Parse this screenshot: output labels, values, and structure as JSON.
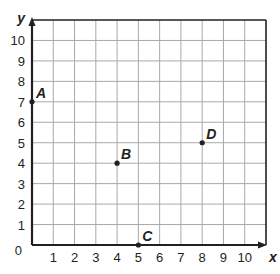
{
  "chart_data": {
    "type": "scatter",
    "title": "",
    "xlabel": "x",
    "ylabel": "y",
    "xlim": [
      0,
      11
    ],
    "ylim": [
      0,
      11
    ],
    "grid": true,
    "x_ticks": [
      "1",
      "2",
      "3",
      "4",
      "5",
      "6",
      "7",
      "8",
      "9",
      "10"
    ],
    "y_ticks": [
      "1",
      "2",
      "3",
      "4",
      "5",
      "6",
      "7",
      "8",
      "9",
      "10"
    ],
    "origin_label": "0",
    "points": [
      {
        "label": "A",
        "x": 0,
        "y": 7
      },
      {
        "label": "B",
        "x": 4,
        "y": 4
      },
      {
        "label": "C",
        "x": 5,
        "y": 0
      },
      {
        "label": "D",
        "x": 8,
        "y": 5
      }
    ],
    "legend": null
  },
  "colors": {
    "axis": "#231f20",
    "grid": "#a7a9ac",
    "point": "#231f20",
    "background": "#ffffff"
  }
}
